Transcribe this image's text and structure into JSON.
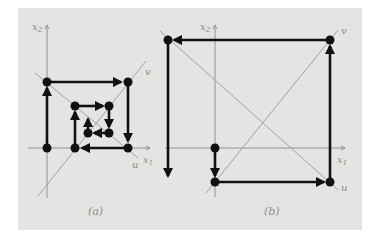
{
  "figure": {
    "background_color": "#e4e4e2",
    "path_color": "#111111",
    "axis_color": "#8a8a8a",
    "panels": [
      {
        "id": "a",
        "caption": "(a)",
        "axis_labels": {
          "x1": "x",
          "x1_sub": "1",
          "x2": "x",
          "x2_sub": "2",
          "u": "u",
          "v": "v"
        },
        "description": "Converging spiral: iteration moves inward toward the intersection of lines u and v",
        "points": [
          [
            47,
            148
          ],
          [
            47,
            82
          ],
          [
            128,
            82
          ],
          [
            128,
            148
          ],
          [
            75,
            148
          ],
          [
            75,
            106
          ],
          [
            109,
            106
          ],
          [
            109,
            133
          ],
          [
            88,
            133
          ]
        ],
        "final_arrow_end": [
          88,
          117
        ]
      },
      {
        "id": "b",
        "caption": "(b)",
        "axis_labels": {
          "x1": "x",
          "x1_sub": "1",
          "x2": "x",
          "x2_sub": "2",
          "u": "u",
          "v": "v"
        },
        "description": "Diverging spiral: iteration moves outward away from the intersection of lines u and v",
        "points": [
          [
            215,
            148
          ],
          [
            215,
            182
          ],
          [
            330,
            182
          ],
          [
            330,
            40
          ],
          [
            168,
            40
          ]
        ],
        "final_arrow_end": [
          168,
          177
        ]
      }
    ]
  }
}
